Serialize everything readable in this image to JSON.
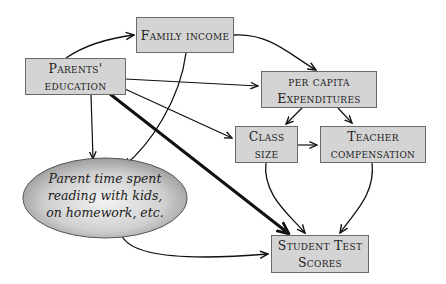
{
  "diagram": {
    "nodes": {
      "family_income": {
        "lines": [
          "Family income"
        ]
      },
      "parents_education": {
        "lines": [
          "Parents'",
          "education"
        ]
      },
      "expenditures": {
        "lines": [
          "per capita",
          "Expenditures"
        ]
      },
      "class_size": {
        "lines": [
          "Class",
          "size"
        ]
      },
      "teacher_comp": {
        "lines": [
          "Teacher",
          "compensation"
        ]
      },
      "parent_time": {
        "lines": [
          "Parent time spent",
          "reading with kids,",
          "on homework, etc."
        ]
      },
      "test_scores": {
        "lines": [
          "Student Test",
          "Scores"
        ]
      }
    },
    "edges": [
      {
        "from": "parents_education",
        "to": "family_income"
      },
      {
        "from": "family_income",
        "to": "expenditures"
      },
      {
        "from": "family_income",
        "to": "parent_time"
      },
      {
        "from": "parents_education",
        "to": "expenditures"
      },
      {
        "from": "parents_education",
        "to": "class_size"
      },
      {
        "from": "parents_education",
        "to": "parent_time"
      },
      {
        "from": "parents_education",
        "to": "test_scores",
        "emphasis": "thick"
      },
      {
        "from": "expenditures",
        "to": "class_size"
      },
      {
        "from": "expenditures",
        "to": "teacher_comp"
      },
      {
        "from": "class_size",
        "to": "teacher_comp"
      },
      {
        "from": "class_size",
        "to": "test_scores"
      },
      {
        "from": "teacher_comp",
        "to": "test_scores"
      },
      {
        "from": "parent_time",
        "to": "test_scores"
      }
    ]
  }
}
